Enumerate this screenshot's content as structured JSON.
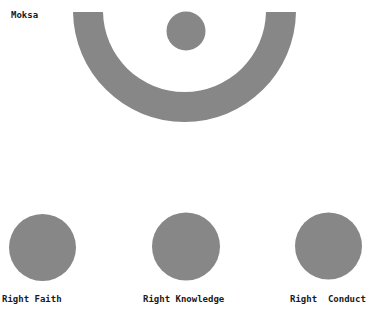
{
  "diagram": {
    "title_label": "Moksa",
    "fill_color": "#878787",
    "moksa": {
      "arc": {
        "cx": 184.5,
        "cy": 10.5,
        "outer_r": 111.5,
        "inner_r": 81.5
      },
      "dot": {
        "cx": 186,
        "cy": 31,
        "r": 19.5
      }
    },
    "jewels": [
      {
        "label": "Right Faith",
        "cx": 42.5,
        "cy": 247.5,
        "r": 33.5
      },
      {
        "label": "Right Knowledge",
        "cx": 186,
        "cy": 246.5,
        "r": 34
      },
      {
        "label": "Right  Conduct",
        "cx": 328.5,
        "cy": 246,
        "r": 33.5
      }
    ]
  }
}
